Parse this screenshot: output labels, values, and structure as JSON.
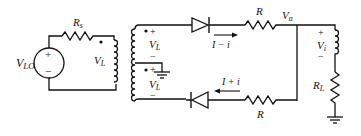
{
  "diagram": {
    "type": "circuit",
    "labels": {
      "source": "V",
      "source_sub": "LO",
      "source_plus": "+",
      "source_minus": "−",
      "rs": "R",
      "rs_sub": "s",
      "primary_v": "V",
      "primary_v_sub": "L",
      "sec_top_v": "V",
      "sec_top_v_sub": "L",
      "sec_bot_v": "V",
      "sec_bot_v_sub": "L",
      "plus": "+",
      "minus": "−",
      "top_current": "I − i",
      "bottom_current": "I + i",
      "r_top": "R",
      "r_bottom": "R",
      "va": "V",
      "va_sub": "a",
      "vi": "V",
      "vi_sub": "i",
      "rl": "R",
      "rl_sub": "L"
    },
    "components": [
      {
        "id": "VLO",
        "kind": "voltage-source"
      },
      {
        "id": "Rs",
        "kind": "resistor"
      },
      {
        "id": "T1",
        "kind": "transformer",
        "secondary": "center-tapped"
      },
      {
        "id": "D1",
        "kind": "diode",
        "direction": "right"
      },
      {
        "id": "D2",
        "kind": "diode",
        "direction": "left"
      },
      {
        "id": "R1",
        "kind": "resistor"
      },
      {
        "id": "R2",
        "kind": "resistor"
      },
      {
        "id": "Li",
        "kind": "inductor"
      },
      {
        "id": "RL",
        "kind": "resistor"
      },
      {
        "id": "GND1",
        "kind": "ground"
      },
      {
        "id": "GND2",
        "kind": "ground"
      }
    ]
  }
}
